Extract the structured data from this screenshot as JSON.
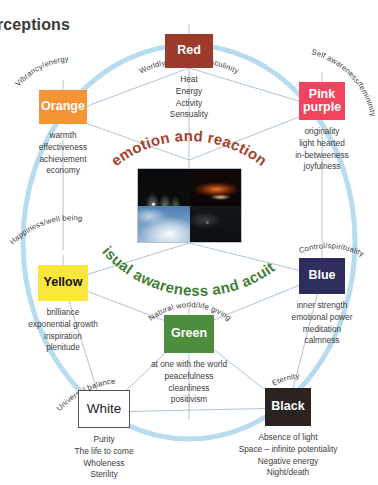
{
  "page_title": "erceptions",
  "center": {
    "arc_top_label": "emotion and reaction",
    "arc_bottom_label": "visual awareness and acuity",
    "arc_top_color": "#a5412c",
    "arc_bottom_color": "#3f7f35",
    "photos": [
      {
        "name": "fireworks-water-arcs-night"
      },
      {
        "name": "orange-fire-glow-night"
      },
      {
        "name": "blue-sky-with-clouds"
      },
      {
        "name": "dark-night-landscape"
      }
    ]
  },
  "ring_color": "#b8dcef",
  "spoke_color": "#9db4c7",
  "nodes": [
    {
      "id": "red",
      "label": "Red",
      "arc_label": "Worldly success/masculinity",
      "color": "#9c3a2b",
      "attributes": [
        "Heat",
        "Energy",
        "Activity",
        "Sensuality"
      ]
    },
    {
      "id": "orange",
      "label": "Orange",
      "arc_label": "Vibrancy/energy",
      "color": "#f49434",
      "attributes": [
        "warmth",
        "effectiveness",
        "achievement",
        "economy"
      ]
    },
    {
      "id": "pink-purple",
      "label": "Pink purple",
      "arc_label": "Self awareness/femininity",
      "color": "#f2445e",
      "attributes": [
        "originality",
        "light hearted",
        "in-betweeness",
        "joyfulness"
      ]
    },
    {
      "id": "yellow",
      "label": "Yellow",
      "arc_label": "Happiness/well being",
      "color": "#fbe63c",
      "attributes": [
        "brilliance",
        "exponential growth",
        "inspiration",
        "plenitude"
      ]
    },
    {
      "id": "blue",
      "label": "Blue",
      "arc_label": "Control/spirituality",
      "color": "#2d2d5e",
      "attributes": [
        "inner strength",
        "emotional power",
        "meditation",
        "calmness"
      ]
    },
    {
      "id": "green",
      "label": "Green",
      "arc_label": "Natural world/life giving",
      "color": "#4e8d3e",
      "attributes": [
        "at one with the world",
        "peacefulness",
        "cleanliness",
        "positivism"
      ]
    },
    {
      "id": "white",
      "label": "White",
      "arc_label": "Universal balance",
      "color": "#ffffff",
      "attributes": [
        "Purity",
        "The life to come",
        "Wholeness",
        "Sterility"
      ]
    },
    {
      "id": "black",
      "label": "Black",
      "arc_label": "Eternity",
      "color": "#2b231f",
      "attributes": [
        "Absence of light",
        "Space – infinite potentiality",
        "Negative energy",
        "Night/death"
      ]
    }
  ]
}
